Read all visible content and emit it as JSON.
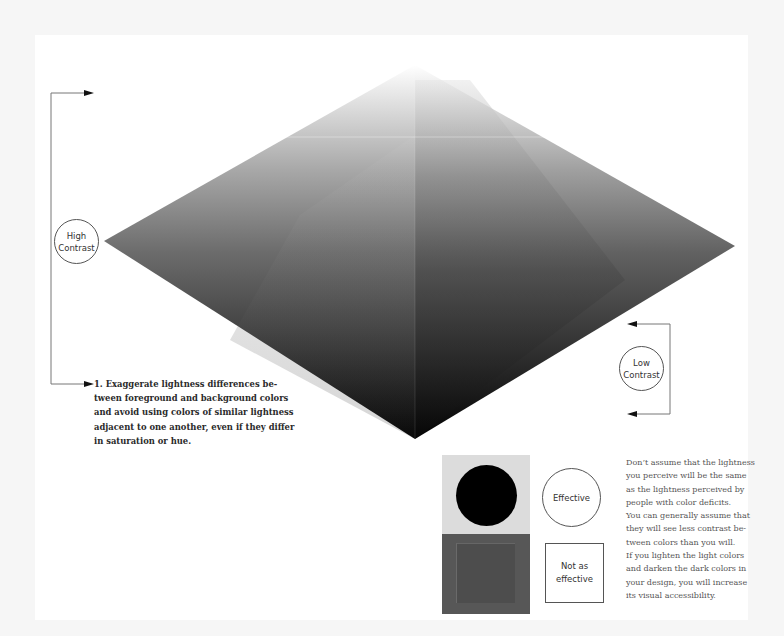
{
  "diagram": {
    "type": "contrast-illustration",
    "shape": "diamond",
    "vertices": {
      "top": [
        415,
        65
      ],
      "left": [
        104,
        241
      ],
      "right": [
        735,
        246
      ],
      "bottom": [
        415,
        439
      ]
    },
    "colors": {
      "background": "#ffffff",
      "outer_background": "#f6f6f6",
      "diamond_light": "#ffffff",
      "diamond_mid": "#6a6a6a",
      "diamond_dark": "#050505",
      "line": "#777777",
      "arrow": "#111111",
      "sample_light": "#dcdcdc",
      "sample_dot": "#000000",
      "sample_dark": "#575757",
      "sample_dark_inner": "#4d4d4d"
    }
  },
  "labels": {
    "high_contrast": [
      "High",
      "Contrast"
    ],
    "low_contrast": [
      "Low",
      "Contrast"
    ],
    "effective": "Effective",
    "not_as_effective": [
      "Not as",
      "effective"
    ]
  },
  "captions": {
    "tip_1": [
      "1. Exaggerate lightness differences be-",
      "tween foreground and background colors",
      "and avoid using colors of similar lightness",
      "adjacent to one another, even if they differ",
      "in saturation or hue."
    ],
    "note": [
      "Don’t assume that the lightness",
      "you perceive will be the same",
      "as the lightness perceived by",
      "people with color deficits.",
      "You can generally assume that",
      "they will see less contrast be-",
      "tween colors than you will.",
      "If you lighten the light colors",
      "and darken the dark colors in",
      "your design, you will increase",
      "its visual accessibility."
    ]
  }
}
